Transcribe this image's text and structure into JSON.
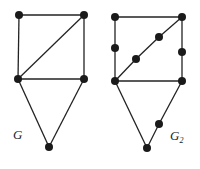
{
  "graphs": [
    {
      "label": "G",
      "subscript": "",
      "label_pos": [
        13,
        139
      ],
      "nodes": [
        [
          19,
          15
        ],
        [
          84,
          15
        ],
        [
          18,
          79
        ],
        [
          84,
          79
        ],
        [
          49,
          147
        ]
      ],
      "edges": [
        [
          0,
          1
        ],
        [
          0,
          2
        ],
        [
          1,
          3
        ],
        [
          2,
          3
        ],
        [
          1,
          2
        ],
        [
          2,
          4
        ],
        [
          3,
          4
        ]
      ]
    },
    {
      "label": "G",
      "subscript": "2",
      "label_pos": [
        170,
        140
      ],
      "nodes": [
        [
          115,
          17
        ],
        [
          182,
          17
        ],
        [
          115,
          48
        ],
        [
          182,
          52
        ],
        [
          159,
          37
        ],
        [
          136,
          59
        ],
        [
          115,
          81
        ],
        [
          182,
          81
        ],
        [
          147,
          148
        ],
        [
          159,
          124
        ]
      ],
      "edges": [
        [
          0,
          1
        ],
        [
          0,
          2
        ],
        [
          2,
          6
        ],
        [
          1,
          3
        ],
        [
          3,
          7
        ],
        [
          6,
          7
        ],
        [
          1,
          4
        ],
        [
          4,
          5
        ],
        [
          5,
          6
        ],
        [
          6,
          8
        ],
        [
          7,
          9
        ],
        [
          9,
          8
        ]
      ]
    }
  ],
  "style": {
    "node_color": "#1a1a1a",
    "edge_color": "#222222",
    "node_radius": 4
  }
}
